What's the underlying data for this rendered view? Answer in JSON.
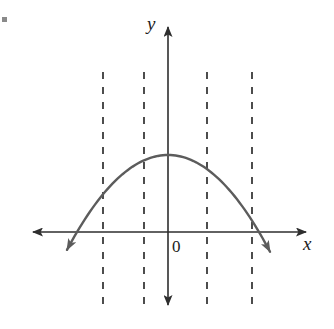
{
  "figure": {
    "width": 334,
    "height": 329,
    "background_color": "#ffffff"
  },
  "labels": {
    "y_axis": "y",
    "x_axis": "x",
    "origin": "0"
  },
  "colors": {
    "axis": "#2e2e2e",
    "curve": "#5c5c5c",
    "dashed_line": "#2e2e2e",
    "text": "#1c1c1c",
    "corner_mark": "#8a8a8a"
  },
  "chart_data": {
    "type": "line",
    "title": "",
    "xlabel": "x",
    "ylabel": "y",
    "grid": false,
    "legend": null,
    "origin_label": "0",
    "axes": {
      "x_axis": {
        "y_pixel": 232,
        "x_start_pixel": 26,
        "x_end_pixel": 313,
        "arrows": [
          "left",
          "right"
        ],
        "label": "x"
      },
      "y_axis": {
        "x_pixel": 168,
        "y_start_pixel": 20,
        "y_end_pixel": 312,
        "arrows": [
          "up",
          "down"
        ],
        "label": "y"
      }
    },
    "series": [
      {
        "name": "parabola",
        "shape": "downward-opening parabola",
        "vertex": {
          "x_pixel": 168,
          "y_pixel": 155
        },
        "x_intercepts_pixel": [
          77,
          259
        ],
        "endpoints_pixel": [
          {
            "x": 58,
            "y": 262,
            "arrow": true
          },
          {
            "x": 279,
            "y": 262,
            "arrow": true
          }
        ],
        "points_pixel": [
          {
            "x": 58,
            "y": 262
          },
          {
            "x": 77,
            "y": 232
          },
          {
            "x": 103,
            "y": 198
          },
          {
            "x": 122,
            "y": 180
          },
          {
            "x": 144,
            "y": 164
          },
          {
            "x": 168,
            "y": 155
          },
          {
            "x": 190,
            "y": 162
          },
          {
            "x": 207,
            "y": 173
          },
          {
            "x": 231,
            "y": 198
          },
          {
            "x": 252,
            "y": 222
          },
          {
            "x": 259,
            "y": 232
          },
          {
            "x": 279,
            "y": 262
          }
        ]
      }
    ],
    "dashed_vertical_lines": [
      {
        "x_pixel": 103,
        "y_top_pixel": 72,
        "y_bottom_pixel": 310
      },
      {
        "x_pixel": 144,
        "y_top_pixel": 72,
        "y_bottom_pixel": 310
      },
      {
        "x_pixel": 207,
        "y_top_pixel": 72,
        "y_bottom_pixel": 310
      },
      {
        "x_pixel": 252,
        "y_top_pixel": 72,
        "y_bottom_pixel": 310
      }
    ],
    "dash_pattern": "7 8"
  }
}
